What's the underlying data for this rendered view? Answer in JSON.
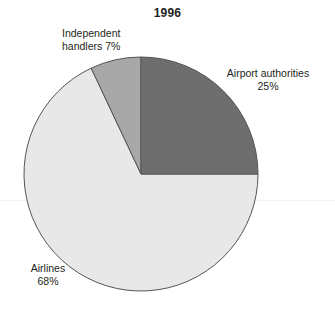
{
  "chart_data": {
    "type": "pie",
    "title": "1996",
    "xlabel": "",
    "ylabel": "",
    "categories": [
      "Airport authorities",
      "Airlines",
      "Independent handlers"
    ],
    "values": [
      25,
      68,
      7
    ],
    "value_unit": "%",
    "legend_position": "none",
    "grid": false,
    "start_angle_deg": 0,
    "direction": "clockwise",
    "slices": [
      {
        "label": "Airport authorities",
        "value": 25,
        "value_text": "25%",
        "color": "#6e6e6e",
        "start_angle_deg": 0,
        "end_angle_deg": 90
      },
      {
        "label": "Airlines",
        "value": 68,
        "value_text": "68%",
        "color": "#e8e8e8",
        "start_angle_deg": 90,
        "end_angle_deg": 334.8
      },
      {
        "label": "Independent handlers",
        "value": 7,
        "value_text": "7%",
        "color": "#a8a8a8",
        "start_angle_deg": 334.8,
        "end_angle_deg": 360
      }
    ]
  },
  "title": "1996",
  "labels": {
    "independent": {
      "line1": "Independent",
      "line2": "handlers 7%"
    },
    "airport": {
      "line1": "Airport authorities",
      "line2": "25%"
    },
    "airlines": {
      "line1": "Airlines",
      "line2": "68%"
    }
  },
  "colors": {
    "airport_authorities": "#6e6e6e",
    "airlines": "#e8e8e8",
    "independent_handlers": "#a8a8a8",
    "outline": "#4d4d4d",
    "text": "#231f20",
    "background": "#ffffff"
  }
}
